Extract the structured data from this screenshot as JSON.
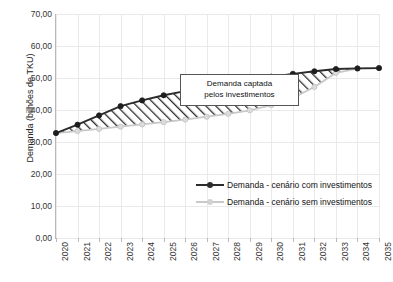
{
  "chart_data": {
    "type": "line",
    "title": "",
    "xlabel": "",
    "ylabel": "Demanda (bilhões de TKU)",
    "x": [
      "2020",
      "2021",
      "2022",
      "2023",
      "2024",
      "2025",
      "2026",
      "2027",
      "2028",
      "2029",
      "2030",
      "2031",
      "2032",
      "2033",
      "2034",
      "2035"
    ],
    "ylim": [
      0,
      70
    ],
    "yticks": [
      "0,00",
      "10,00",
      "20,00",
      "30,00",
      "40,00",
      "50,00",
      "60,00",
      "70,00"
    ],
    "ytick_values": [
      0,
      10,
      20,
      30,
      40,
      50,
      60,
      70
    ],
    "grid": true,
    "legend_position": "inside-lower-right",
    "series": [
      {
        "name": "Demanda - cenário com investimentos",
        "color": "#2b2b2b",
        "marker": "circle",
        "values": [
          32.8,
          35.4,
          38.3,
          41.2,
          43.0,
          44.6,
          45.9,
          47.1,
          48.2,
          49.1,
          50.4,
          51.3,
          52.1,
          52.8,
          53.0,
          53.1
        ]
      },
      {
        "name": "Demanda - cenário sem investimentos",
        "color": "#c9c9c9",
        "marker": "circle",
        "values": [
          32.8,
          33.4,
          34.1,
          34.8,
          35.5,
          36.2,
          37.0,
          37.9,
          38.8,
          39.9,
          41.5,
          43.8,
          47.2,
          51.6,
          52.9,
          53.1
        ]
      }
    ],
    "annotations": [
      {
        "name": "captured-demand-callout",
        "line1": "Demanda captada",
        "line2": "pelos investimentos"
      }
    ],
    "fill_between": {
      "label": "Demanda captada pelos investimentos",
      "pattern": "diagonal-hatch",
      "upper_series": "Demanda - cenário com investimentos",
      "lower_series": "Demanda - cenário sem investimentos"
    }
  },
  "legend": {
    "items": [
      {
        "label": "Demanda - cenário com investimentos",
        "color": "#2b2b2b"
      },
      {
        "label": "Demanda - cenário sem investimentos",
        "color": "#c9c9c9"
      }
    ]
  }
}
